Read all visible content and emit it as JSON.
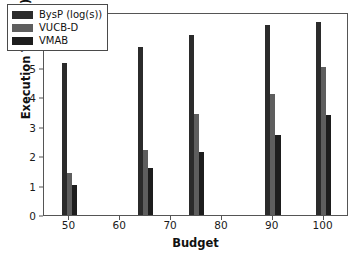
{
  "chart_data": {
    "type": "bar",
    "title": "",
    "xlabel": "Budget",
    "ylabel": "Execution Time (s)",
    "categories": [
      50,
      65,
      75,
      90,
      100
    ],
    "xlim": [
      45,
      105
    ],
    "ylim": [
      0,
      6.9
    ],
    "xticks": [
      50,
      60,
      70,
      80,
      90,
      100
    ],
    "yticks": [
      0,
      1,
      2,
      3,
      4,
      5,
      6
    ],
    "grid": false,
    "legend_position": "upper left",
    "series": [
      {
        "name": "BysP (log(s))",
        "color": "#2b2b2b",
        "values": [
          5.17,
          5.71,
          6.12,
          6.45,
          6.56
        ]
      },
      {
        "name": "VUCB-D",
        "color": "#5e5e5e",
        "values": [
          1.42,
          2.2,
          3.42,
          4.1,
          5.03
        ]
      },
      {
        "name": "VMAB",
        "color": "#1d1d1d",
        "values": [
          1.03,
          1.6,
          2.14,
          2.71,
          3.41
        ]
      }
    ]
  },
  "axes": {
    "ylabel": "Execution Time (s)",
    "xlabel": "Budget",
    "ytick_labels": [
      "0",
      "1",
      "2",
      "3",
      "4",
      "5",
      "6"
    ],
    "xtick_labels": [
      "50",
      "60",
      "70",
      "80",
      "90",
      "100"
    ]
  },
  "legend": {
    "items": [
      {
        "label": "BysP (log(s))"
      },
      {
        "label": "VUCB-D"
      },
      {
        "label": "VMAB"
      }
    ]
  }
}
